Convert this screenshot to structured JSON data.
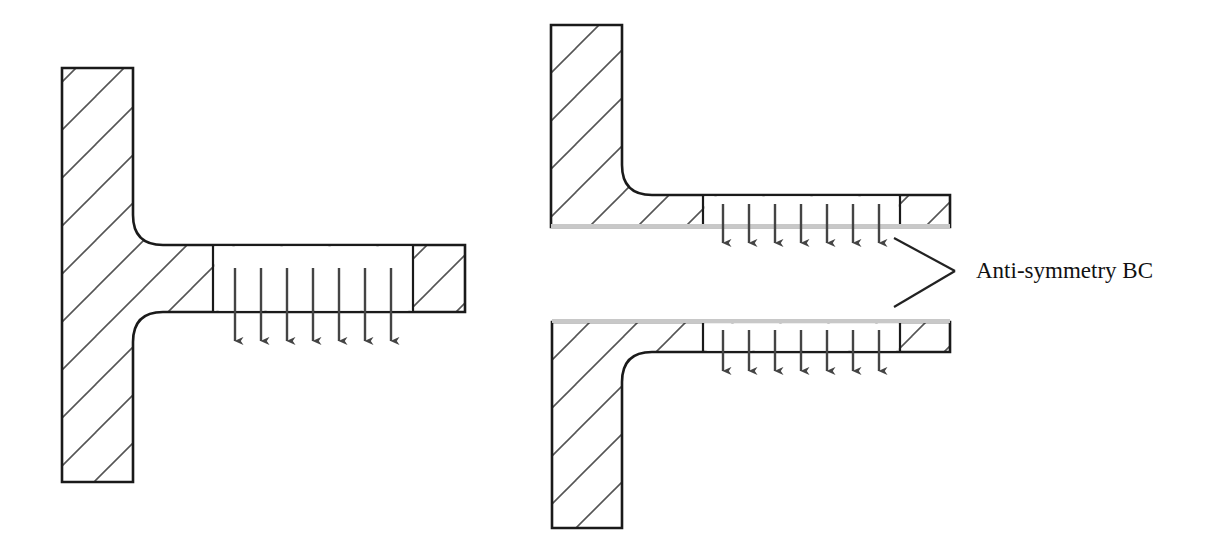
{
  "figure": {
    "background_color": "#ffffff",
    "outline_color": "#1a1a1a",
    "hatch_color": "#555555",
    "arrow_color": "#444444",
    "bc_line_color": "#c8c8c8",
    "leader_color": "#222222"
  },
  "annotations": {
    "anti_symmetry_label": "Anti-symmetry BC"
  },
  "panels": [
    {
      "id": "full-t-section",
      "name": "full-model",
      "role": "Full T-section with distributed downward load on flange",
      "stem": {
        "x": 62,
        "y": 68,
        "width": 71,
        "height": 414
      },
      "flange": {
        "x": 133,
        "y": 245,
        "width": 332,
        "height": 67
      },
      "fillet_radius": 30,
      "divider_x": 213,
      "end_block": {
        "x": 413,
        "width": 52
      },
      "bc_line": null,
      "load": {
        "type": "distributed-downward",
        "arrow_count": 7,
        "first_arrow_x": 235,
        "arrow_spacing": 26,
        "arrow_top_y": 268,
        "arrow_tip_y": 351
      }
    },
    {
      "id": "upper-half-section",
      "name": "upper-half-model",
      "role": "Upper half L-section with anti-symmetry BC along bottom edge",
      "stem": {
        "x": 551,
        "y": 25,
        "width": 71,
        "height": 205
      },
      "flange": {
        "x": 622,
        "y": 195,
        "width": 328,
        "height": 29
      },
      "fillet_radius": 30,
      "divider_x": 703,
      "end_block": {
        "x": 900,
        "width": 50
      },
      "bc_line": {
        "x1": 551,
        "x2": 950,
        "y": 227
      },
      "load": {
        "type": "distributed-downward",
        "arrow_count": 7,
        "first_arrow_x": 723,
        "arrow_spacing": 26,
        "arrow_top_y": 204,
        "arrow_tip_y": 253
      }
    },
    {
      "id": "lower-half-section",
      "name": "lower-half-model",
      "role": "Lower half L-section with anti-symmetry BC along top edge",
      "stem": {
        "x": 552,
        "y": 322,
        "width": 70,
        "height": 206
      },
      "flange": {
        "x": 622,
        "y": 322,
        "width": 328,
        "height": 30
      },
      "fillet_radius": 30,
      "divider_x": 703,
      "end_block": {
        "x": 900,
        "width": 50
      },
      "bc_line": {
        "x1": 552,
        "x2": 950,
        "y": 319
      },
      "load": {
        "type": "distributed-downward",
        "arrow_count": 7,
        "first_arrow_x": 723,
        "arrow_spacing": 26,
        "arrow_top_y": 330,
        "arrow_tip_y": 381
      }
    }
  ],
  "leaders": [
    {
      "name": "leader-to-upper-panel",
      "x1": 955,
      "y1": 271,
      "x2": 894,
      "y2": 238
    },
    {
      "name": "leader-to-lower-panel",
      "x1": 955,
      "y1": 271,
      "x2": 894,
      "y2": 307
    }
  ],
  "label_position": {
    "x": 976,
    "y": 278
  }
}
